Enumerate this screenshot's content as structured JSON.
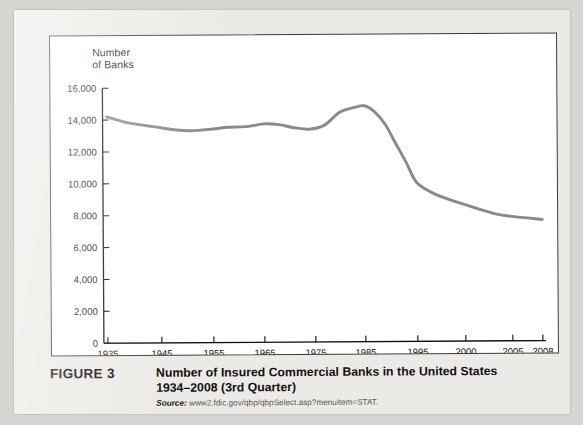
{
  "figure": {
    "label": "FIGURE 3",
    "title_line1": "Number of Insured Commercial Banks in the United States",
    "title_line2": "1934–2008 (3rd Quarter)",
    "source_label": "Source:",
    "source_url": "www2.fdic.gov/qbp/qbpSelect.asp?menuitem=STAT."
  },
  "chart_data": {
    "type": "line",
    "title": "Number of Insured Commercial Banks in the United States 1934–2008 (3rd Quarter)",
    "xlabel": "",
    "ylabel": "Number\nof Banks",
    "ylabel_line1": "Number",
    "ylabel_line2": "of Banks",
    "xlim": [
      1935,
      2008
    ],
    "ylim": [
      0,
      16000
    ],
    "ytick_labels": [
      "16,000",
      "14,000",
      "12,000",
      "10,000",
      "8,000",
      "6,000",
      "4,000",
      "2,000",
      "0"
    ],
    "ytick_values": [
      16000,
      14000,
      12000,
      10000,
      8000,
      6000,
      4000,
      2000,
      0
    ],
    "xtick_labels": [
      "1935",
      "1945",
      "1955",
      "1965",
      "1975",
      "1985",
      "1995",
      "2000",
      "2005",
      "2008"
    ],
    "xtick_values": [
      1935,
      1945,
      1955,
      1965,
      1975,
      1985,
      1995,
      2000,
      2005,
      2008
    ],
    "x_axis_scale": "non-uniform (decades through 1995, then 5-year steps)",
    "grid": false,
    "legend": null,
    "line_color": "#8a8a8a",
    "series": [
      {
        "name": "Insured commercial banks",
        "x": [
          1935,
          1938,
          1941,
          1945,
          1948,
          1951,
          1955,
          1958,
          1962,
          1965,
          1968,
          1971,
          1974,
          1977,
          1980,
          1983,
          1985,
          1987,
          1989,
          1991,
          1993,
          1995,
          1997,
          2000,
          2003,
          2005,
          2008
        ],
        "values": [
          14200,
          13900,
          13700,
          13500,
          13350,
          13300,
          13400,
          13500,
          13550,
          13700,
          13650,
          13450,
          13350,
          13600,
          14400,
          14700,
          14800,
          14400,
          13600,
          12400,
          11200,
          9950,
          9200,
          8550,
          8000,
          7800,
          7600
        ]
      }
    ]
  }
}
